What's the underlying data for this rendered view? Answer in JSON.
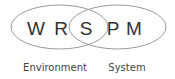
{
  "diagram": {
    "type": "venn",
    "sets": [
      {
        "name": "environment",
        "label": "Environment",
        "letters": [
          "W",
          "R"
        ]
      },
      {
        "name": "system",
        "label": "System",
        "letters": [
          "P",
          "M"
        ]
      }
    ],
    "intersection": {
      "letters": [
        "S"
      ]
    },
    "letters": {
      "w": "W",
      "r": "R",
      "s": "S",
      "p": "P",
      "m": "M"
    },
    "labels": {
      "environment": "Environment",
      "system": "System"
    },
    "colors": {
      "stroke": "#9a9a9a",
      "letter": "#333333",
      "label": "#444444",
      "background": "#ffffff"
    }
  }
}
